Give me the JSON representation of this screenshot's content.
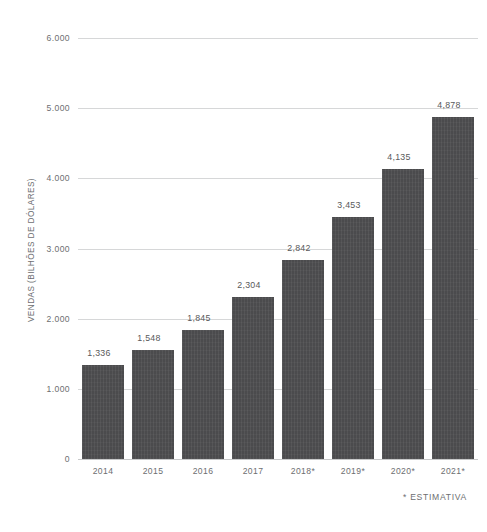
{
  "chart_data": {
    "type": "bar",
    "title": "",
    "subtitle": "",
    "xlabel": "",
    "ylabel": "VENDAS (BILHÕES DE DÓLARES)",
    "categories": [
      "2014",
      "2015",
      "2016",
      "2017",
      "2018*",
      "2019*",
      "2020*",
      "2021*"
    ],
    "values": [
      1336,
      1548,
      1845,
      2304,
      2842,
      3453,
      4135,
      4878
    ],
    "value_labels": [
      "1,336",
      "1,548",
      "1,845",
      "2,304",
      "2,842",
      "3,453",
      "4,135",
      "4,878"
    ],
    "ylim": [
      0,
      6000
    ],
    "ytick_values": [
      0,
      1000,
      2000,
      3000,
      4000,
      5000,
      6000
    ],
    "ytick_labels": [
      "0",
      "1.000",
      "2.000",
      "3.000",
      "4.000",
      "5.000",
      "6.000"
    ],
    "grid": true,
    "legend": "none",
    "annotations": [
      "* ESTIMATIVA"
    ],
    "colors": {
      "bar": "#4b4b4d",
      "gridline": "#d6d7d8",
      "text": "#6d6e71",
      "background": "#ffffff"
    }
  },
  "footnote": {
    "text": "* ESTIMATIVA"
  }
}
